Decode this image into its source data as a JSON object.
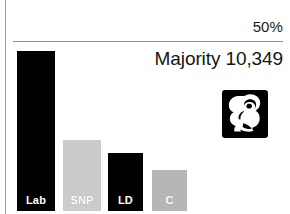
{
  "chart_data": {
    "type": "bar",
    "title": "",
    "subtitle": "",
    "categories": [
      "Lab",
      "SNP",
      "LD",
      "C"
    ],
    "values": [
      47,
      21,
      17,
      12
    ],
    "series": [
      {
        "name": "Vote share",
        "values": [
          47,
          21,
          17,
          12
        ]
      }
    ],
    "bar_colors": [
      "#000000",
      "#cbcbcb",
      "#000000",
      "#b6b6b6"
    ],
    "label_colors": [
      "#ffffff",
      "#ffffff",
      "#ffffff",
      "#ffffff"
    ],
    "xlabel": "",
    "ylabel": "",
    "ylim": [
      0,
      50
    ],
    "grid": false,
    "legend": "none",
    "threshold": {
      "value": 50,
      "label": "50%"
    },
    "annotations": [
      {
        "name": "majority",
        "text": "Majority 10,349"
      }
    ]
  },
  "annotation": {
    "majority_text": "Majority 10,349"
  },
  "axis": {
    "threshold_label": "50%"
  },
  "bars": [
    {
      "label": "Lab",
      "value": 47,
      "color": "#000000"
    },
    {
      "label": "SNP",
      "value": 21,
      "color": "#cbcbcb"
    },
    {
      "label": "LD",
      "value": 17,
      "color": "#000000"
    },
    {
      "label": "C",
      "value": 12,
      "color": "#b6b6b6"
    }
  ],
  "logo": {
    "name": "labour-rose-icon",
    "alt": "Labour Party rose emblem"
  },
  "colors": {
    "ink": "#000000",
    "rule": "#8c8c8c",
    "background": "#ffffff"
  }
}
